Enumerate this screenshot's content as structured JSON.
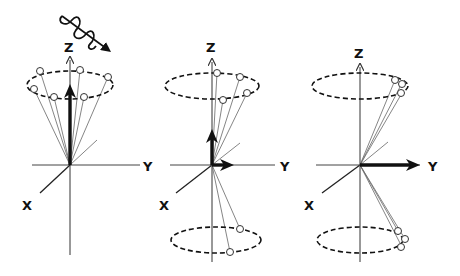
{
  "diagram": {
    "type": "nmr-spin-precession-3-panel",
    "colors": {
      "ink": "#111111",
      "thin": "#555555",
      "background": "#ffffff"
    },
    "panels": [
      {
        "id": "before-pulse",
        "axis_labels": {
          "z": "Z",
          "y": "Y",
          "x": "X"
        },
        "rf_pulse_icon": "wavy-arrow",
        "net_magnetization": "along +Z",
        "spins_upper_cone": 6,
        "spins_lower_cone": 0
      },
      {
        "id": "partial-flip",
        "axis_labels": {
          "z": "Z",
          "y": "Y",
          "x": "X"
        },
        "net_magnetization": "tilted, components along +Z and +Y",
        "spins_upper_cone": 4,
        "spins_lower_cone": 2
      },
      {
        "id": "90-degree-phase-coherent",
        "axis_labels": {
          "z": "Z",
          "y": "Y",
          "x": "X"
        },
        "net_magnetization": "along +Y",
        "spins_upper_cone": 3,
        "spins_lower_cone": 3
      }
    ]
  }
}
